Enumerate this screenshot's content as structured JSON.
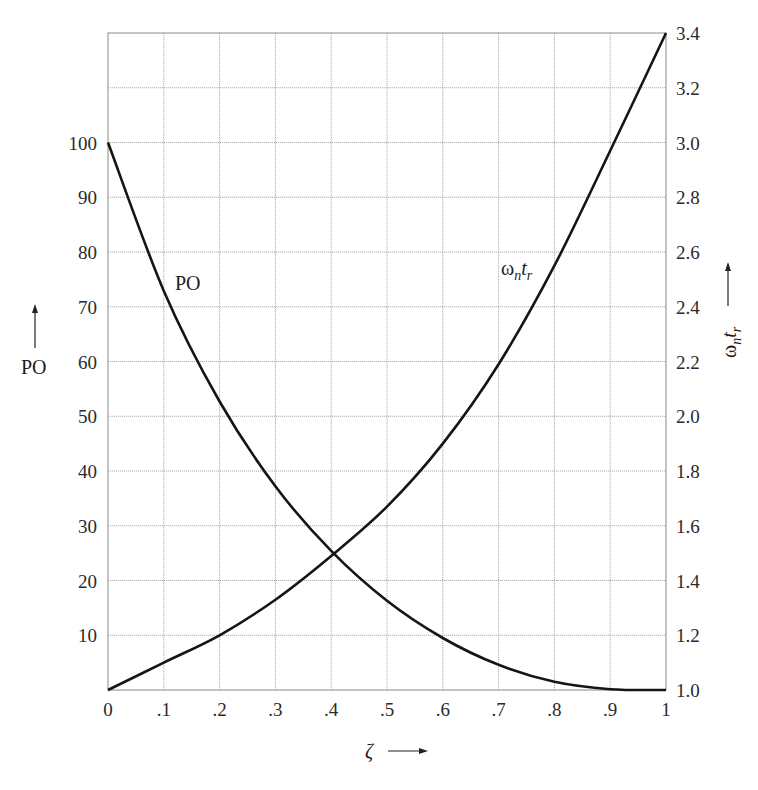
{
  "chart_data": {
    "type": "line",
    "title": "",
    "xlabel": "ζ",
    "ylabel_left": "PO",
    "ylabel_right": "ωntr",
    "xlim": [
      0,
      1
    ],
    "ylim_left": [
      0,
      120
    ],
    "ylim_right": [
      1.0,
      3.4
    ],
    "grid": true,
    "x_ticks": [
      "0",
      ".1",
      ".2",
      ".3",
      ".4",
      ".5",
      ".6",
      ".7",
      ".8",
      ".9",
      "1"
    ],
    "y_left_ticks": [
      "10",
      "20",
      "30",
      "40",
      "50",
      "60",
      "70",
      "80",
      "90",
      "100"
    ],
    "y_right_ticks": [
      "1.0",
      "1.2",
      "1.4",
      "1.6",
      "1.8",
      "2.0",
      "2.2",
      "2.4",
      "2.6",
      "2.8",
      "3.0",
      "3.2",
      "3.4"
    ],
    "x": [
      0,
      0.1,
      0.2,
      0.3,
      0.4,
      0.5,
      0.6,
      0.7,
      0.8,
      0.9,
      1.0
    ],
    "series": [
      {
        "name": "PO",
        "axis": "left",
        "values": [
          100,
          72.9,
          52.7,
          37.2,
          25.4,
          16.3,
          9.5,
          4.6,
          1.5,
          0.15,
          0
        ]
      },
      {
        "name": "ωntr",
        "axis": "right",
        "values": [
          1.0,
          1.1,
          1.2,
          1.33,
          1.49,
          1.67,
          1.9,
          2.19,
          2.55,
          2.97,
          3.4
        ]
      }
    ],
    "annotations": [
      {
        "text": "PO",
        "near_x": 0.14,
        "near_y_left": 73
      },
      {
        "text": "ωntr",
        "near_x": 0.73,
        "near_y_right": 2.5
      }
    ]
  },
  "labels": {
    "x_axis": "ζ",
    "left_axis": "PO",
    "right_axis_main": "ω",
    "right_axis_sub1": "n",
    "right_axis_t": "t",
    "right_axis_sub2": "r",
    "curve_po": "PO",
    "curve_w_main": "ω",
    "curve_w_sub1": "n",
    "curve_w_t": "t",
    "curve_w_sub2": "r"
  }
}
